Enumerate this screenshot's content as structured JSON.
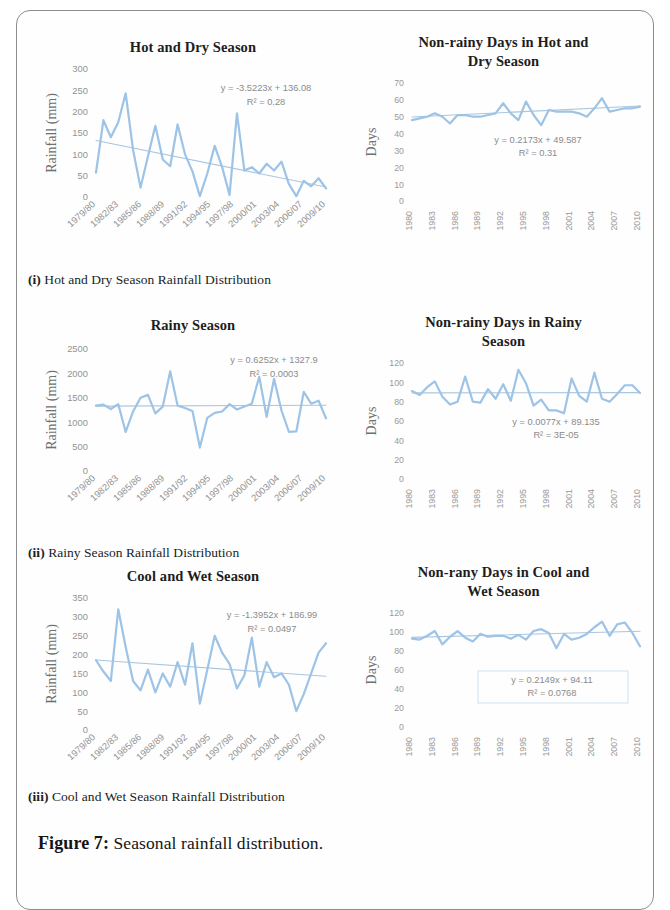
{
  "figure": {
    "caption_lead": "Figure 7:",
    "caption_text": " Seasonal rainfall distribution."
  },
  "style": {
    "series_color": "#9dc3e6",
    "trend_color": "#a8c6e0",
    "tick_color": "#939393",
    "axis_title_color": "#6f6f6f"
  },
  "panels": [
    {
      "id": "hot-dry-rainfall",
      "title": "Hot and Dry Season",
      "subcaption_lead": "(i)",
      "subcaption_text": " Hot and Dry Season Rainfall Distribution",
      "equation": "y = -3.5223x + 136.08",
      "r2": "R² = 0.28",
      "boxed_equation": false
    },
    {
      "id": "hot-dry-nonrainy",
      "title_line1": "Non-rainy Days in Hot and",
      "title_line2": "Dry Season",
      "equation": "y = 0.2173x + 49.587",
      "r2": "R² = 0.31",
      "boxed_equation": false
    },
    {
      "id": "rainy-rainfall",
      "title": "Rainy Season",
      "subcaption_lead": "(ii)",
      "subcaption_text": " Rainy Season Rainfall Distribution",
      "equation": "y = 0.6252x + 1327.9",
      "r2": "R² = 0.0003",
      "boxed_equation": false
    },
    {
      "id": "rainy-nonrainy",
      "title_line1": "Non-rainy Days in Rainy",
      "title_line2": "Season",
      "equation": "y = 0.0077x + 89.135",
      "r2": "R² = 3E-05",
      "boxed_equation": false
    },
    {
      "id": "cool-wet-rainfall",
      "title": "Cool and Wet Season",
      "subcaption_lead": "(iii)",
      "subcaption_text": " Cool and Wet Season Rainfall Distribution",
      "equation": "y = -1.3952x + 186.99",
      "r2": "R² = 0.0497",
      "boxed_equation": false
    },
    {
      "id": "cool-wet-nonrainy",
      "title_line1": "Non-rany Days in Cool and",
      "title_line2": "Wet Season",
      "equation": "y = 0.2149x + 94.11",
      "r2": "R² = 0.0768",
      "boxed_equation": true
    }
  ],
  "chart_data": [
    {
      "id": "hot-dry-rainfall",
      "type": "line",
      "title": "Hot and Dry Season",
      "xlabel": "",
      "ylabel": "Rainfall (mm)",
      "ylim": [
        0,
        300
      ],
      "yticks": [
        0,
        50,
        100,
        150,
        200,
        250,
        300
      ],
      "xticks": [
        "1979/80",
        "1982/83",
        "1985/86",
        "1988/89",
        "1991/92",
        "1994/95",
        "1997/98",
        "2000/01",
        "2003/04",
        "2006/07",
        "2009/10"
      ],
      "grid": false,
      "trendline": {
        "slope": -3.5223,
        "intercept": 136.08,
        "r2": 0.28,
        "label": "y = -3.5223x + 136.08"
      },
      "x": [
        1979,
        1980,
        1981,
        1982,
        1983,
        1984,
        1985,
        1986,
        1987,
        1988,
        1989,
        1990,
        1991,
        1992,
        1993,
        1994,
        1995,
        1996,
        1997,
        1998,
        1999,
        2000,
        2001,
        2002,
        2003,
        2004,
        2005,
        2006,
        2007,
        2008,
        2009,
        2010
      ],
      "values": [
        57,
        180,
        140,
        175,
        243,
        110,
        22,
        95,
        167,
        88,
        72,
        170,
        100,
        60,
        2,
        55,
        120,
        70,
        5,
        196,
        62,
        70,
        55,
        78,
        62,
        83,
        30,
        2,
        38,
        25,
        44,
        20
      ]
    },
    {
      "id": "hot-dry-nonrainy",
      "type": "line",
      "title": "Non-rainy Days in Hot and Dry Season",
      "xlabel": "",
      "ylabel": "Days",
      "ylim": [
        0,
        70
      ],
      "yticks": [
        0,
        10,
        20,
        30,
        40,
        50,
        60,
        70
      ],
      "xticks": [
        "1980",
        "1983",
        "1986",
        "1989",
        "1992",
        "1995",
        "1998",
        "2001",
        "2004",
        "2007",
        "2010"
      ],
      "grid": false,
      "trendline": {
        "slope": 0.2173,
        "intercept": 49.587,
        "r2": 0.31,
        "label": "y = 0.2173x + 49.587"
      },
      "x": [
        1980,
        1981,
        1982,
        1983,
        1984,
        1985,
        1986,
        1987,
        1988,
        1989,
        1990,
        1991,
        1992,
        1993,
        1994,
        1995,
        1996,
        1997,
        1998,
        1999,
        2000,
        2001,
        2002,
        2003,
        2004,
        2005,
        2006,
        2007,
        2008,
        2009,
        2010
      ],
      "values": [
        48,
        49,
        50,
        52,
        50,
        46,
        51,
        51,
        50,
        50,
        51,
        52,
        58,
        52,
        48,
        59,
        51,
        45,
        54,
        53,
        53,
        53,
        52,
        50,
        55,
        61,
        53,
        54,
        55,
        55,
        56
      ]
    },
    {
      "id": "rainy-rainfall",
      "type": "line",
      "title": "Rainy Season",
      "xlabel": "",
      "ylabel": "Rainfall (mm)",
      "ylim": [
        0,
        2500
      ],
      "yticks": [
        0,
        500,
        1000,
        1500,
        2000,
        2500
      ],
      "xticks": [
        "1979/80",
        "1982/83",
        "1985/86",
        "1988/89",
        "1991/92",
        "1994/95",
        "1997/98",
        "2000/01",
        "2003/04",
        "2006/07",
        "2009/10"
      ],
      "grid": false,
      "trendline": {
        "slope": 0.6252,
        "intercept": 1327.9,
        "r2": 0.0003,
        "label": "y = 0.6252x + 1327.9"
      },
      "x": [
        1979,
        1980,
        1981,
        1982,
        1983,
        1984,
        1985,
        1986,
        1987,
        1988,
        1989,
        1990,
        1991,
        1992,
        1993,
        1994,
        1995,
        1996,
        1997,
        1998,
        1999,
        2000,
        2001,
        2002,
        2003,
        2004,
        2005,
        2006,
        2007,
        2008,
        2009,
        2010
      ],
      "values": [
        1340,
        1360,
        1270,
        1370,
        800,
        1220,
        1500,
        1560,
        1180,
        1320,
        2040,
        1340,
        1290,
        1230,
        480,
        1090,
        1190,
        1220,
        1370,
        1260,
        1320,
        1380,
        1930,
        1110,
        1890,
        1240,
        800,
        810,
        1620,
        1380,
        1440,
        1080
      ]
    },
    {
      "id": "rainy-nonrainy",
      "type": "line",
      "title": "Non-rainy Days in Rainy Season",
      "xlabel": "",
      "ylabel": "Days",
      "ylim": [
        0,
        120
      ],
      "yticks": [
        0,
        20,
        40,
        60,
        80,
        100,
        120
      ],
      "xticks": [
        "1980",
        "1983",
        "1986",
        "1989",
        "1992",
        "1995",
        "1998",
        "2001",
        "2004",
        "2007",
        "2010"
      ],
      "grid": false,
      "trendline": {
        "slope": 0.0077,
        "intercept": 89.135,
        "r2": 3e-05,
        "label": "y = 0.0077x + 89.135"
      },
      "x": [
        1980,
        1981,
        1982,
        1983,
        1984,
        1985,
        1986,
        1987,
        1988,
        1989,
        1990,
        1991,
        1992,
        1993,
        1994,
        1995,
        1996,
        1997,
        1998,
        1999,
        2000,
        2001,
        2002,
        2003,
        2004,
        2005,
        2006,
        2007,
        2008,
        2009,
        2010
      ],
      "values": [
        91,
        87,
        95,
        101,
        85,
        77,
        80,
        106,
        80,
        79,
        93,
        83,
        98,
        81,
        113,
        99,
        76,
        82,
        71,
        71,
        68,
        104,
        86,
        80,
        110,
        83,
        80,
        88,
        97,
        97,
        89
      ]
    },
    {
      "id": "cool-wet-rainfall",
      "type": "line",
      "title": "Cool and Wet Season",
      "xlabel": "",
      "ylabel": "Rainfall (mm)",
      "ylim": [
        0,
        350
      ],
      "yticks": [
        0,
        50,
        100,
        150,
        200,
        250,
        300,
        350
      ],
      "xticks": [
        "1979/80",
        "1982/83",
        "1985/86",
        "1988/89",
        "1991/92",
        "1994/95",
        "1997/98",
        "2000/01",
        "2003/04",
        "2006/07",
        "2009/10"
      ],
      "grid": false,
      "trendline": {
        "slope": -1.3952,
        "intercept": 186.99,
        "r2": 0.0497,
        "label": "y = -1.3952x + 186.99"
      },
      "x": [
        1979,
        1980,
        1981,
        1982,
        1983,
        1984,
        1985,
        1986,
        1987,
        1988,
        1989,
        1990,
        1991,
        1992,
        1993,
        1994,
        1995,
        1996,
        1997,
        1998,
        1999,
        2000,
        2001,
        2002,
        2003,
        2004,
        2005,
        2006,
        2007,
        2008,
        2009,
        2010
      ],
      "values": [
        185,
        155,
        130,
        320,
        220,
        130,
        105,
        160,
        100,
        150,
        115,
        180,
        120,
        230,
        70,
        160,
        250,
        205,
        175,
        110,
        145,
        245,
        115,
        180,
        140,
        150,
        120,
        50,
        95,
        150,
        205,
        230
      ]
    },
    {
      "id": "cool-wet-nonrainy",
      "type": "line",
      "title": "Non-rany Days in Cool and Wet Season",
      "xlabel": "",
      "ylabel": "Days",
      "ylim": [
        0,
        120
      ],
      "yticks": [
        0,
        20,
        40,
        60,
        80,
        100,
        120
      ],
      "xticks": [
        "1980",
        "1983",
        "1986",
        "1989",
        "1992",
        "1995",
        "1998",
        "2001",
        "2004",
        "2007",
        "2010"
      ],
      "grid": false,
      "trendline": {
        "slope": 0.2149,
        "intercept": 94.11,
        "r2": 0.0768,
        "label": "y = 0.2149x + 94.11"
      },
      "x": [
        1980,
        1981,
        1982,
        1983,
        1984,
        1985,
        1986,
        1987,
        1988,
        1989,
        1990,
        1991,
        1992,
        1993,
        1994,
        1995,
        1996,
        1997,
        1998,
        1999,
        2000,
        2001,
        2002,
        2003,
        2004,
        2005,
        2006,
        2007,
        2008,
        2009,
        2010
      ],
      "values": [
        93,
        92,
        96,
        101,
        87,
        95,
        101,
        94,
        90,
        98,
        95,
        96,
        96,
        93,
        97,
        92,
        101,
        103,
        99,
        83,
        98,
        92,
        94,
        98,
        105,
        111,
        96,
        108,
        110,
        99,
        85
      ]
    }
  ]
}
